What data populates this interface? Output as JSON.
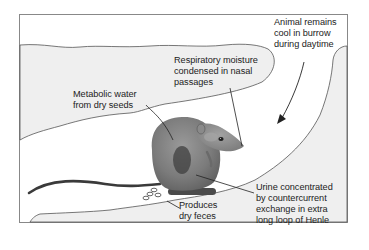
{
  "figure": {
    "type": "illustration",
    "colors": {
      "frame_border": "#777777",
      "soil_fill": "#efefef",
      "burrow_fill": "#ffffff",
      "outline": "#555555",
      "rat_body": "#7d7d7d",
      "rat_shadow": "#3c3c3c",
      "text": "#222222"
    }
  },
  "labels": {
    "burrow_cool": {
      "lines": [
        "Animal remains",
        "cool in burrow",
        "during daytime"
      ]
    },
    "respiratory": {
      "lines": [
        "Respiratory moisture",
        "condensed in nasal",
        "passages"
      ]
    },
    "metabolic": {
      "lines": [
        "Metabolic water",
        "from dry seeds"
      ]
    },
    "urine": {
      "lines": [
        "Urine concentrated",
        "by countercurrent",
        "exchange in extra",
        "long loop of Henle"
      ]
    },
    "feces": {
      "lines": [
        "Produces",
        "dry feces"
      ]
    }
  }
}
